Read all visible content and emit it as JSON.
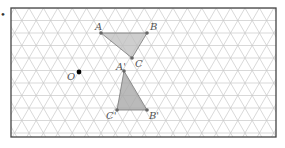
{
  "diagram": {
    "type": "triangular-grid-rotation",
    "bullet": "•",
    "frame": {
      "x": 11,
      "y": 8,
      "width": 265,
      "height": 129,
      "stroke": "#444444"
    },
    "grid": {
      "spacing": 14.4,
      "row_height": 12.5,
      "color": "#c8c8c8"
    },
    "center": {
      "label": "O",
      "x": 79,
      "y": 72
    },
    "triangle_original": {
      "fill": "#bdbdbd",
      "points": [
        {
          "label": "A",
          "x": 101,
          "y": 33
        },
        {
          "label": "B",
          "x": 147,
          "y": 33
        },
        {
          "label": "C",
          "x": 132,
          "y": 58
        }
      ]
    },
    "triangle_image": {
      "fill": "#a9a9a9",
      "points": [
        {
          "label": "A'",
          "x": 124,
          "y": 71
        },
        {
          "label": "B'",
          "x": 147,
          "y": 110
        },
        {
          "label": "C'",
          "x": 117,
          "y": 110
        }
      ]
    }
  }
}
